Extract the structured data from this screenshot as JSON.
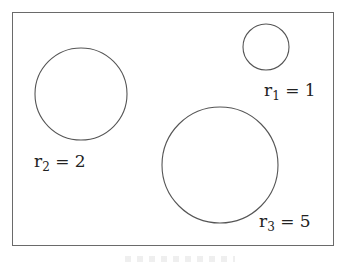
{
  "diagram": {
    "frame": {
      "x": 12,
      "y": 12,
      "width": 322,
      "height": 234,
      "stroke": "#6a6a6a"
    },
    "circles": [
      {
        "id": "c1",
        "cx": 266,
        "cy": 47,
        "r": 23,
        "stroke": "#555555",
        "label": {
          "var": "r",
          "sub": "1",
          "eq": " = 1",
          "x": 264,
          "y": 82
        }
      },
      {
        "id": "c2",
        "cx": 81,
        "cy": 94,
        "r": 46,
        "stroke": "#555555",
        "label": {
          "var": "r",
          "sub": "2",
          "eq": " = 2",
          "x": 34,
          "y": 153
        }
      },
      {
        "id": "c3",
        "cx": 220,
        "cy": 165,
        "r": 58,
        "stroke": "#555555",
        "label": {
          "var": "r",
          "sub": "3",
          "eq": " = 5",
          "x": 259,
          "y": 213
        }
      }
    ]
  }
}
